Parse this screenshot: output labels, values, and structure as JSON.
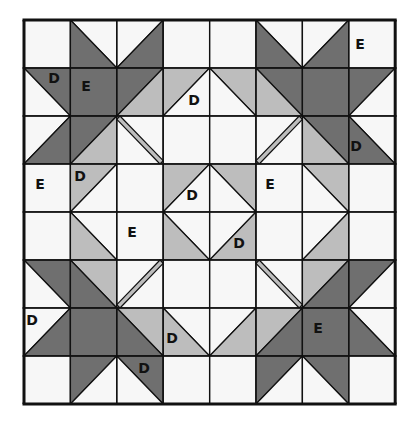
{
  "diagram": {
    "grid": {
      "cols": 8,
      "rows": 8,
      "x0": 24,
      "y0": 20,
      "cell_w": 46.4,
      "cell_h": 48
    },
    "colors": {
      "white": "#f7f7f7",
      "light": "#bdbdbd",
      "dark": "#6f6f6f",
      "line": "#111111"
    },
    "cells": [
      [
        "W",
        "TLBR:dark-bl",
        "TRBL:dark-br",
        "W",
        "W",
        "TLBR:dark-bl",
        "TRBL:dark-br",
        "W"
      ],
      [
        "TLBR:dark-tr",
        "DARK",
        "TRBL:dark-tl|light-br",
        "TRBL:light-tl",
        "TLBR:light-tr",
        "TLBR:dark-tr|light-bl",
        "DARK",
        "TRBL:dark-tl"
      ],
      [
        "TRBL:dark-br",
        "TRBL:dark-tl|light-br",
        "STRIP-TLBR",
        "W",
        "W",
        "STRIP-TRBL",
        "TLBR:light-bl|dark-tr",
        "TLBR:dark-bl"
      ],
      [
        "W",
        "TRBL:light-tl",
        "W",
        "TRBL:light-tl",
        "TLBR:light-tr",
        "W",
        "TLBR:light-tr",
        "W"
      ],
      [
        "W",
        "TLBR:light-bl",
        "W",
        "TLBR:light-bl",
        "TRBL:light-br",
        "W",
        "TRBL:light-br",
        "W"
      ],
      [
        "TLBR:dark-tr",
        "TLBR:light-tr|dark-bl",
        "STRIP-TRBL",
        "W",
        "W",
        "STRIP-TLBR",
        "TRBL:light-tl|dark-br",
        "TRBL:dark-tl"
      ],
      [
        "TRBL:dark-br",
        "DARK",
        "TLBR:dark-bl|light-tr",
        "TLBR:light-bl",
        "TRBL:light-br",
        "TRBL:light-tl|dark-br",
        "DARK",
        "TLBR:dark-bl"
      ],
      [
        "W",
        "TRBL:dark-tl",
        "TLBR:dark-tr",
        "W",
        "W",
        "TRBL:dark-tl",
        "TLBR:dark-tr",
        "W"
      ]
    ],
    "labels": [
      {
        "text": "D",
        "x": 54,
        "y": 83
      },
      {
        "text": "E",
        "x": 86,
        "y": 91
      },
      {
        "text": "E",
        "x": 360,
        "y": 49
      },
      {
        "text": "D",
        "x": 194,
        "y": 105
      },
      {
        "text": "D",
        "x": 356,
        "y": 151
      },
      {
        "text": "E",
        "x": 40,
        "y": 189
      },
      {
        "text": "D",
        "x": 80,
        "y": 181
      },
      {
        "text": "D",
        "x": 192,
        "y": 200
      },
      {
        "text": "E",
        "x": 270,
        "y": 189
      },
      {
        "text": "E",
        "x": 132,
        "y": 237
      },
      {
        "text": "D",
        "x": 239,
        "y": 248
      },
      {
        "text": "D",
        "x": 32,
        "y": 325
      },
      {
        "text": "D",
        "x": 172,
        "y": 343
      },
      {
        "text": "E",
        "x": 318,
        "y": 333
      },
      {
        "text": "D",
        "x": 144,
        "y": 373
      }
    ]
  }
}
